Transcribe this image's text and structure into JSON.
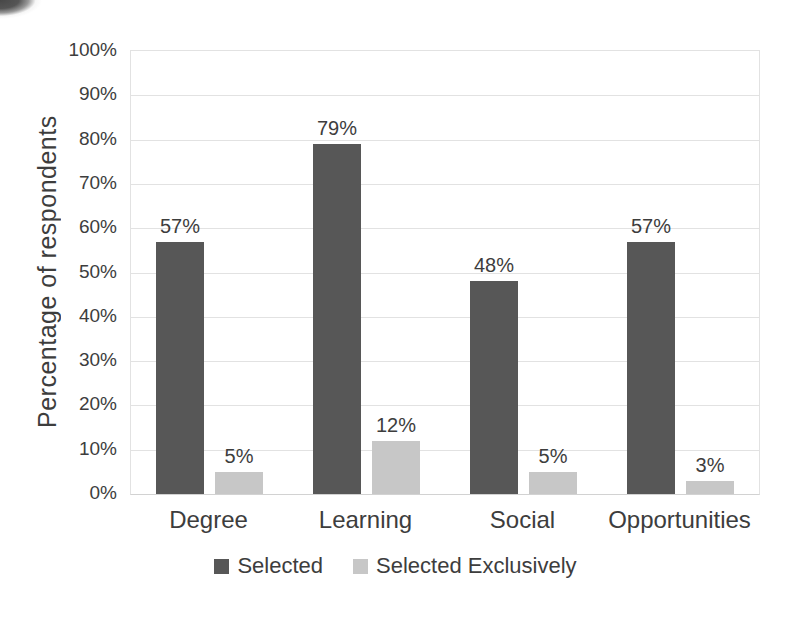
{
  "figure": {
    "background_color": "#ffffff",
    "text_color": "#3d3d3d",
    "gridline_color": "#e2e2e2",
    "axis_line_color": "#d2d2d2"
  },
  "chart_data": {
    "type": "bar",
    "title": "",
    "xlabel": "",
    "ylabel": "Percentage of respondents",
    "categories": [
      "Degree",
      "Learning",
      "Social",
      "Opportunities"
    ],
    "series": [
      {
        "name": "Selected",
        "color": "#575757",
        "values": [
          57,
          79,
          48,
          57
        ]
      },
      {
        "name": "Selected Exclusively",
        "color": "#c7c7c7",
        "values": [
          5,
          12,
          5,
          3
        ]
      }
    ],
    "data_labels": [
      [
        "57%",
        "79%",
        "48%",
        "57%"
      ],
      [
        "5%",
        "12%",
        "5%",
        "3%"
      ]
    ],
    "value_suffix": "%",
    "ylim": [
      0,
      100
    ],
    "ytick_step": 10,
    "ytick_labels": [
      "0%",
      "10%",
      "20%",
      "30%",
      "40%",
      "50%",
      "60%",
      "70%",
      "80%",
      "90%",
      "100%"
    ],
    "grid": "horizontal",
    "legend_position": "bottom"
  }
}
